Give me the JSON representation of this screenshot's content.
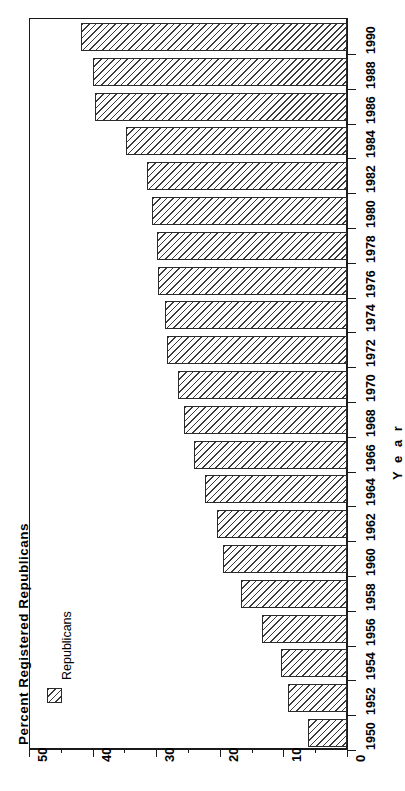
{
  "chart_data": {
    "type": "bar",
    "orientation": "horizontal-rotated",
    "title": "",
    "xlabel": "Year",
    "ylabel": "Percent Registered Republicans",
    "ylim": [
      0,
      50
    ],
    "grid": false,
    "legend_position": "left-inside",
    "legend": [
      "Republicans"
    ],
    "value_ticks_major": [
      "50",
      "40",
      "30",
      "20",
      "10",
      "0"
    ],
    "value_tick_values": [
      50,
      40,
      30,
      20,
      10,
      0
    ],
    "value_ticks_minor": [
      45,
      35,
      25,
      15,
      5
    ],
    "categories": [
      "1950",
      "1952",
      "1954",
      "1956",
      "1958",
      "1960",
      "1962",
      "1964",
      "1966",
      "1968",
      "1970",
      "1972",
      "1974",
      "1976",
      "1978",
      "1980",
      "1982",
      "1984",
      "1986",
      "1988",
      "1990"
    ],
    "series": [
      {
        "name": "Republicans",
        "values": [
          6.1,
          9.3,
          10.4,
          13.4,
          16.7,
          19.5,
          20.4,
          22.4,
          24.0,
          25.6,
          26.5,
          28.3,
          28.6,
          29.7,
          29.9,
          30.6,
          31.5,
          34.7,
          39.6,
          39.9,
          41.8
        ]
      }
    ]
  },
  "axes": {
    "value_axis_title": "Percent  Registered  Republicans",
    "category_axis_title": "Y e a r"
  },
  "legend": {
    "entries": [
      {
        "label": "Republicans",
        "swatch": "hatched-swatch"
      }
    ]
  }
}
